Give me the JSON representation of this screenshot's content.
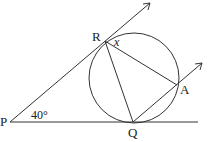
{
  "diagram": {
    "points": {
      "P": {
        "label": "P",
        "x": 10,
        "y": 122
      },
      "R": {
        "label": "R",
        "x": 105,
        "y": 41
      },
      "Q": {
        "label": "Q",
        "x": 133,
        "y": 122
      },
      "A": {
        "label": "A",
        "x": 177,
        "y": 85
      }
    },
    "circle": {
      "cx": 134,
      "cy": 78,
      "r": 45
    },
    "angles": {
      "at_P": "40°",
      "at_R": "x"
    },
    "lines": [
      "PR (tangent, arrow)",
      "PQ (tangent)",
      "QA (arrow)",
      "RQ",
      "RA"
    ]
  }
}
